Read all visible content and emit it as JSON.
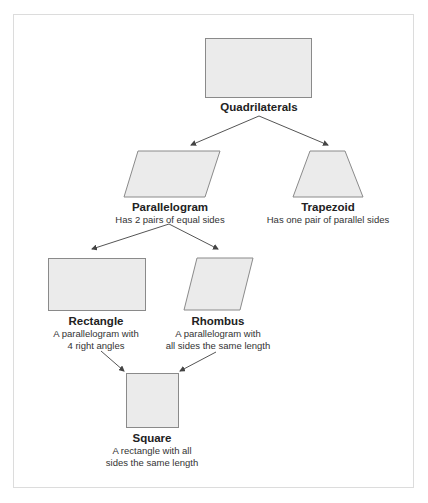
{
  "diagram": {
    "type": "hierarchy",
    "colors": {
      "shape_fill": "#ebebeb",
      "shape_stroke": "#8a8a8a",
      "arrow": "#555555",
      "frame": "#dcdcdc"
    },
    "nodes": {
      "quadrilaterals": {
        "title": "Quadrilaterals",
        "desc": ""
      },
      "parallelogram": {
        "title": "Parallelogram",
        "desc": "Has 2 pairs of equal sides"
      },
      "trapezoid": {
        "title": "Trapezoid",
        "desc": "Has one pair of parallel sides"
      },
      "rectangle": {
        "title": "Rectangle",
        "desc_line1": "A parallelogram with",
        "desc_line2": "4 right angles"
      },
      "rhombus": {
        "title": "Rhombus",
        "desc_line1": "A parallelogram with",
        "desc_line2": "all sides the same length"
      },
      "square": {
        "title": "Square",
        "desc_line1": "A rectangle with all",
        "desc_line2": "sides the same length"
      }
    },
    "edges": [
      {
        "from": "quadrilaterals",
        "to": "parallelogram"
      },
      {
        "from": "quadrilaterals",
        "to": "trapezoid"
      },
      {
        "from": "parallelogram",
        "to": "rectangle"
      },
      {
        "from": "parallelogram",
        "to": "rhombus"
      },
      {
        "from": "rectangle",
        "to": "square"
      },
      {
        "from": "rhombus",
        "to": "square"
      }
    ]
  }
}
